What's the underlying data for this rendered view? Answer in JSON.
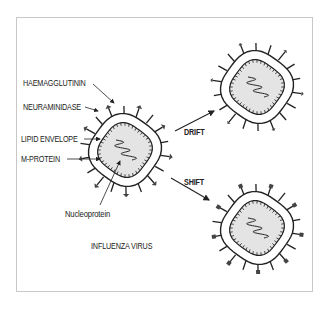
{
  "labels": {
    "haemagglutinin": "HAEMAGGLUTININ",
    "neuraminidase": "NEURAMINIDASE",
    "lipid_envelope": "LIPID ENVELOPE",
    "m_protein": "M-PROTEIN",
    "nucleoprotein": "Nucleoprotein",
    "caption": "INFLUENZA VIRUS",
    "drift": "DRIFT",
    "shift": "SHIFT"
  },
  "colors": {
    "ink": "#222222",
    "core_fill": "#e4e4e4",
    "frame": "#c8c8c8"
  },
  "viruses": [
    {
      "name": "original",
      "cx": 125,
      "cy": 150,
      "spike_style": "arrow"
    },
    {
      "name": "drift-variant",
      "cx": 257,
      "cy": 87,
      "spike_style": "small-arrow"
    },
    {
      "name": "shift-variant",
      "cx": 257,
      "cy": 228,
      "spike_style": "square"
    }
  ]
}
